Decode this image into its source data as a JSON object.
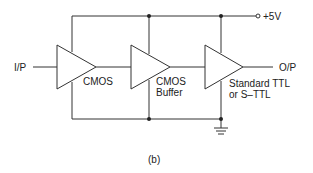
{
  "diagram": {
    "caption": "(b)",
    "supply_label": "+5V",
    "input_label": "I/P",
    "output_label": "O/P",
    "stages": [
      {
        "name": "CMOS",
        "label_lines": [
          "CMOS"
        ]
      },
      {
        "name": "CMOS Buffer",
        "label_lines": [
          "CMOS",
          "Buffer"
        ]
      },
      {
        "name": "Standard TTL or S-TTL",
        "label_lines": [
          "Standard TTL",
          "or S–TTL"
        ]
      }
    ],
    "ground_symbol": "ground-icon",
    "colors": {
      "line": "#333333",
      "background": "#ffffff"
    }
  }
}
